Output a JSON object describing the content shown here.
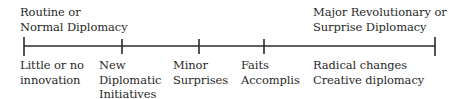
{
  "diagram": {
    "type": "continuum",
    "top_labels": {
      "left": [
        "Routine or",
        "Normal Diplomacy"
      ],
      "right": [
        "Major Revolutionary or",
        "Surprise Diplomacy"
      ]
    },
    "points": [
      {
        "x": 24,
        "label": [
          "Little or no",
          "innovation"
        ]
      },
      {
        "x": 122,
        "label": [
          "New",
          "Diplomatic",
          "Initiatives"
        ]
      },
      {
        "x": 199,
        "label": [
          "Minor",
          "Surprises"
        ]
      },
      {
        "x": 264,
        "label": [
          "Faits",
          "Accomplis"
        ]
      },
      {
        "x": 435,
        "label": [
          "Radical changes",
          "Creative diplomacy"
        ]
      }
    ],
    "line_color": "#2a2a2a"
  }
}
